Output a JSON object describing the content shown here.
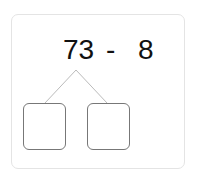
{
  "problem": {
    "operand1": "73",
    "operator": "-",
    "operand2": "8"
  },
  "decomposition": {
    "boxes": [
      {
        "value": ""
      },
      {
        "value": ""
      }
    ]
  },
  "colors": {
    "text": "#111111",
    "card_border": "#e4e4e4",
    "box_border": "#777777",
    "branch_line": "#bbbbbb"
  }
}
